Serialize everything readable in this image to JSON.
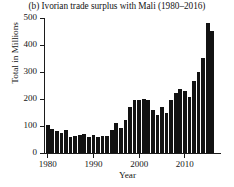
{
  "chart_data": {
    "type": "bar",
    "title": "(b) Ivorian trade surplus with Mali (1980–2016)",
    "xlabel": "Year",
    "ylabel": "Total in Millions",
    "xlim": [
      1979.4,
      2016.6
    ],
    "ylim": [
      0,
      500
    ],
    "grid": false,
    "legend": null,
    "bar_color": "#121212",
    "axis_color": "#1b1b1b",
    "yticks": [
      0,
      100,
      200,
      300,
      400,
      500
    ],
    "ytick_labels": [
      "0",
      "100",
      "200",
      "300",
      "400",
      "500"
    ],
    "xticks": [
      1980,
      1990,
      2000,
      2010
    ],
    "xtick_labels": [
      "1980",
      "1990",
      "2000",
      "2010"
    ],
    "categories": [
      1980,
      1981,
      1982,
      1983,
      1984,
      1985,
      1986,
      1987,
      1988,
      1989,
      1990,
      1991,
      1992,
      1993,
      1994,
      1995,
      1996,
      1997,
      1998,
      1999,
      2000,
      2001,
      2002,
      2003,
      2004,
      2005,
      2006,
      2007,
      2008,
      2009,
      2010,
      2011,
      2012,
      2013,
      2014,
      2015,
      2016
    ],
    "values": [
      103,
      88,
      80,
      75,
      86,
      60,
      62,
      68,
      72,
      60,
      66,
      58,
      64,
      62,
      84,
      110,
      94,
      122,
      172,
      196,
      196,
      200,
      196,
      160,
      140,
      172,
      150,
      196,
      222,
      236,
      228,
      206,
      268,
      300,
      352,
      481,
      452
    ]
  }
}
